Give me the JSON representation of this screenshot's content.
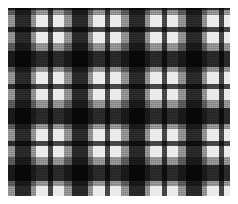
{
  "swatch": {
    "kind": "tartan-plaid-fabric-swatch",
    "width_px": 238,
    "height_px": 204,
    "margin_px": 8,
    "pattern_width_px": 222,
    "pattern_height_px": 188,
    "background_color": "#ffffff",
    "base_color": "#ebebeb",
    "weave_texture": true,
    "symmetric_sett": true,
    "sett_period_px": 57
  },
  "palette": {
    "highlight": "#ebebeb",
    "light_gray": "#cfcfcf",
    "mid_gray": "#9a9a9a",
    "dark_gray": "#6e6e6e",
    "charcoal": "#4a4a4a",
    "black": "#1d1d1d"
  },
  "chart_data": {
    "type": "heatmap",
    "xlabel": "",
    "ylabel": "",
    "sett_period_px": 57,
    "legend_position": "none",
    "grid": false,
    "note": "Identical stripe sequence on warp and weft; crossing bands multiply to darken.",
    "sett_bands": [
      {
        "name": "highlight-ground",
        "offset_px": 0,
        "width_px": 12,
        "color": "#ffffff",
        "alpha": 0.0
      },
      {
        "name": "charcoal-guard",
        "offset_px": 12,
        "width_px": 5,
        "color": "#4a4a4a",
        "alpha": 1.0
      },
      {
        "name": "highlight-ground",
        "offset_px": 17,
        "width_px": 11,
        "color": "#ffffff",
        "alpha": 0.0
      },
      {
        "name": "mid-gray-band",
        "offset_px": 28,
        "width_px": 8,
        "color": "#9a9a9a",
        "alpha": 1.0
      },
      {
        "name": "black-block",
        "offset_px": 36,
        "width_px": 16,
        "color": "#2a2a2a",
        "alpha": 1.0
      },
      {
        "name": "mid-gray-band",
        "offset_px": 52,
        "width_px": 5,
        "color": "#9a9a9a",
        "alpha": 1.0
      }
    ],
    "columns": [
      {
        "index": 0,
        "offset_px": -17,
        "width_px": 5,
        "band": "charcoal-guard",
        "color": "#4a4a4a"
      },
      {
        "index": 1,
        "offset_px": -1,
        "width_px": 8,
        "band": "mid-gray-band",
        "color": "#9a9a9a"
      },
      {
        "index": 2,
        "offset_px": 7,
        "width_px": 16,
        "band": "black-block",
        "color": "#2a2a2a"
      },
      {
        "index": 3,
        "offset_px": 23,
        "width_px": 5,
        "band": "mid-gray-band",
        "color": "#9a9a9a"
      },
      {
        "index": 4,
        "offset_px": 40,
        "width_px": 5,
        "band": "charcoal-guard",
        "color": "#4a4a4a"
      },
      {
        "index": 5,
        "offset_px": 56,
        "width_px": 8,
        "band": "mid-gray-band",
        "color": "#9a9a9a"
      },
      {
        "index": 6,
        "offset_px": 64,
        "width_px": 16,
        "band": "black-block",
        "color": "#2a2a2a"
      },
      {
        "index": 7,
        "offset_px": 80,
        "width_px": 5,
        "band": "mid-gray-band",
        "color": "#9a9a9a"
      },
      {
        "index": 8,
        "offset_px": 97,
        "width_px": 5,
        "band": "charcoal-guard",
        "color": "#4a4a4a"
      },
      {
        "index": 9,
        "offset_px": 113,
        "width_px": 8,
        "band": "mid-gray-band",
        "color": "#9a9a9a"
      },
      {
        "index": 10,
        "offset_px": 121,
        "width_px": 16,
        "band": "black-block",
        "color": "#2a2a2a"
      },
      {
        "index": 11,
        "offset_px": 137,
        "width_px": 5,
        "band": "mid-gray-band",
        "color": "#9a9a9a"
      },
      {
        "index": 12,
        "offset_px": 154,
        "width_px": 5,
        "band": "charcoal-guard",
        "color": "#4a4a4a"
      },
      {
        "index": 13,
        "offset_px": 170,
        "width_px": 8,
        "band": "mid-gray-band",
        "color": "#9a9a9a"
      },
      {
        "index": 14,
        "offset_px": 178,
        "width_px": 16,
        "band": "black-block",
        "color": "#2a2a2a"
      },
      {
        "index": 15,
        "offset_px": 194,
        "width_px": 5,
        "band": "mid-gray-band",
        "color": "#9a9a9a"
      },
      {
        "index": 16,
        "offset_px": 211,
        "width_px": 5,
        "band": "charcoal-guard",
        "color": "#4a4a4a"
      }
    ],
    "rows": [
      {
        "index": 0,
        "offset_px": -14,
        "height_px": 16,
        "band": "black-block",
        "color": "#2a2a2a"
      },
      {
        "index": 1,
        "offset_px": 2,
        "height_px": 5,
        "band": "mid-gray-band",
        "color": "#9a9a9a"
      },
      {
        "index": 2,
        "offset_px": 19,
        "height_px": 5,
        "band": "charcoal-guard",
        "color": "#4a4a4a"
      },
      {
        "index": 3,
        "offset_px": 35,
        "height_px": 8,
        "band": "mid-gray-band",
        "color": "#9a9a9a"
      },
      {
        "index": 4,
        "offset_px": 43,
        "height_px": 16,
        "band": "black-block",
        "color": "#2a2a2a"
      },
      {
        "index": 5,
        "offset_px": 59,
        "height_px": 5,
        "band": "mid-gray-band",
        "color": "#9a9a9a"
      },
      {
        "index": 6,
        "offset_px": 76,
        "height_px": 5,
        "band": "charcoal-guard",
        "color": "#4a4a4a"
      },
      {
        "index": 7,
        "offset_px": 92,
        "height_px": 8,
        "band": "mid-gray-band",
        "color": "#9a9a9a"
      },
      {
        "index": 8,
        "offset_px": 100,
        "height_px": 16,
        "band": "black-block",
        "color": "#2a2a2a"
      },
      {
        "index": 9,
        "offset_px": 116,
        "height_px": 5,
        "band": "mid-gray-band",
        "color": "#9a9a9a"
      },
      {
        "index": 10,
        "offset_px": 133,
        "height_px": 5,
        "band": "charcoal-guard",
        "color": "#4a4a4a"
      },
      {
        "index": 11,
        "offset_px": 149,
        "height_px": 8,
        "band": "mid-gray-band",
        "color": "#9a9a9a"
      },
      {
        "index": 12,
        "offset_px": 157,
        "height_px": 16,
        "band": "black-block",
        "color": "#2a2a2a"
      },
      {
        "index": 13,
        "offset_px": 173,
        "height_px": 5,
        "band": "mid-gray-band",
        "color": "#9a9a9a"
      },
      {
        "index": 14,
        "offset_px": 190,
        "height_px": 5,
        "band": "charcoal-guard",
        "color": "#4a4a4a"
      }
    ]
  }
}
